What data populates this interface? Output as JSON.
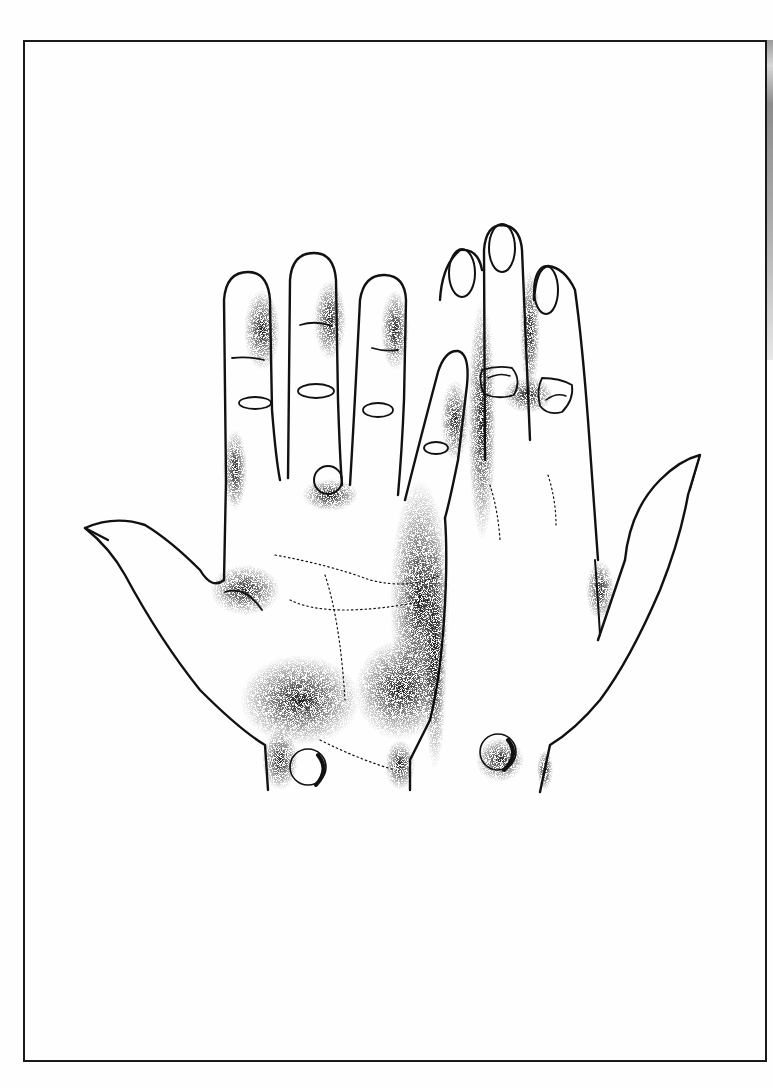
{
  "figure": {
    "palette": {
      "ink": "#111111",
      "paper": "#fefefe",
      "frame": "#1a1a1a",
      "edge_shadow": "#9a9a9a"
    },
    "elements": {
      "left_hand": "palm-view hand with thumb extended left",
      "right_hand": "back-view hand with thumb extended right",
      "nodules": [
        {
          "location": "left hand, base between middle and ring finger"
        },
        {
          "location": "left hand, wrist"
        },
        {
          "location": "right hand, middle finger knuckle"
        },
        {
          "location": "right hand, ring finger knuckle"
        },
        {
          "location": "right hand, wrist"
        }
      ]
    }
  }
}
